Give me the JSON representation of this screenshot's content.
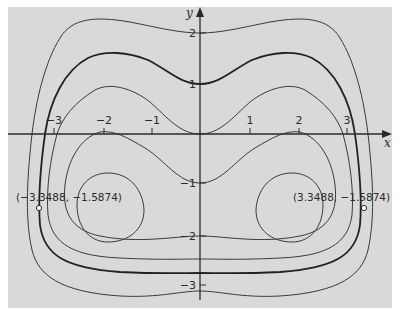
{
  "figure": {
    "background_color": "#d9d9d9",
    "curve_color": "#333333",
    "axes": {
      "x_label": "x",
      "y_label": "y",
      "x_ticks": [
        {
          "value": -3,
          "label": "−3"
        },
        {
          "value": -2,
          "label": "−2"
        },
        {
          "value": -1,
          "label": "−1"
        },
        {
          "value": 1,
          "label": "1"
        },
        {
          "value": 2,
          "label": "2"
        },
        {
          "value": 3,
          "label": "3"
        }
      ],
      "y_ticks": [
        {
          "value": 2,
          "label": "2"
        },
        {
          "value": 1,
          "label": "1"
        },
        {
          "value": -1,
          "label": "−1"
        },
        {
          "value": -2,
          "label": "−2"
        },
        {
          "value": -3,
          "label": "−3"
        }
      ]
    },
    "points": [
      {
        "label": "(−3.3488, −1.5874)",
        "x": -3.3488,
        "y": -1.5874
      },
      {
        "label": "(3.3488, −1.5874)",
        "x": 3.3488,
        "y": -1.5874
      }
    ],
    "level_curves": [
      {
        "name": "outer",
        "emphasis": false
      },
      {
        "name": "highlighted",
        "emphasis": true
      },
      {
        "name": "through-origin",
        "emphasis": false
      },
      {
        "name": "inner",
        "emphasis": false
      },
      {
        "name": "left-oval",
        "emphasis": false
      },
      {
        "name": "right-oval",
        "emphasis": false
      }
    ]
  }
}
